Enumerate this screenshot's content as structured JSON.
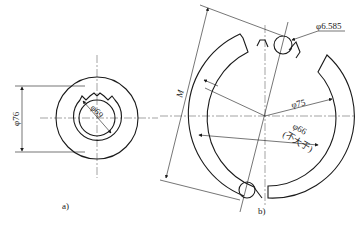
{
  "figure_a": {
    "label": "a)",
    "dim_outer": "φ76",
    "dim_inner": "φ69"
  },
  "figure_b": {
    "label": "b)",
    "dim_ball": "φ6.585",
    "dim_outer": "φ75",
    "dim_inner": "φ66",
    "dim_inner_note": "(不大于)",
    "dim_span": "M"
  },
  "colors": {
    "line": "#1a1a1a",
    "background": "#ffffff"
  }
}
